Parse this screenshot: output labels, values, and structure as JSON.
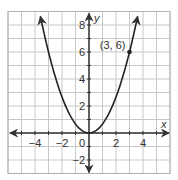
{
  "chart_data": {
    "type": "line",
    "title": "",
    "xlabel": "x",
    "ylabel": "y",
    "xlim": [
      -6,
      6
    ],
    "ylim": [
      -3,
      9
    ],
    "grid": true,
    "grid_step": 1,
    "colors": {
      "grid": "#c8c8c8",
      "axis": "#333333",
      "curve": "#222222",
      "frame": "#b0b0b0"
    },
    "x_ticks": [
      {
        "value": -4,
        "label": "−4"
      },
      {
        "value": -2,
        "label": "−2"
      },
      {
        "value": 2,
        "label": "2"
      },
      {
        "value": 4,
        "label": "4"
      }
    ],
    "y_ticks": [
      {
        "value": 8,
        "label": "8"
      },
      {
        "value": 6,
        "label": "6"
      },
      {
        "value": 4,
        "label": "4"
      },
      {
        "value": 2,
        "label": "2"
      },
      {
        "value": -2,
        "label": "−2"
      }
    ],
    "origin_label": "0",
    "series": [
      {
        "name": "parabola",
        "equation": "y = (2/3)x^2",
        "coefficient": 0.6667,
        "x_range": [
          -3.6,
          3.6
        ],
        "arrows_at_ends": true
      }
    ],
    "points": [
      {
        "x": 3,
        "y": 6,
        "label": "(3, 6)"
      }
    ]
  }
}
